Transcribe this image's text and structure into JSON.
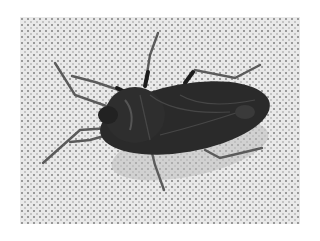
{
  "image": {
    "subject": "bug",
    "description": "Dark brown shield-shaped true bug photographed from above on a white dotted textured fabric",
    "colors": {
      "background": "#ffffff",
      "fabric": "#e9e9e9",
      "fabric_dots": "#9a9a9a",
      "body": "#2a2a2a",
      "body_highlight": "#4a4a4a",
      "legs": "#5a5a5a",
      "shadow": "#bdbdbd"
    }
  }
}
